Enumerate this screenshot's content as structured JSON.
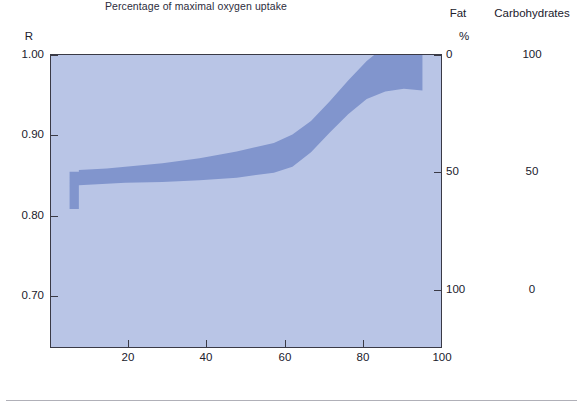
{
  "figure": {
    "y_axis_title": "R",
    "x_axis_title": "Percentage of maximal oxygen uptake",
    "header_fat": "Fat",
    "header_carbohydrates": "Carbohydrates",
    "header_percent": "%"
  },
  "chart_data": {
    "type": "area",
    "title": "",
    "subtitle": "",
    "xlabel": "Percentage of maximal oxygen uptake",
    "ylabel": "R",
    "xlim": [
      0,
      105
    ],
    "ylim": [
      0.655,
      1.0
    ],
    "grid": false,
    "legend": null,
    "x_ticks": [
      20,
      40,
      60,
      80,
      100
    ],
    "x_tick_labels": [
      "20",
      "40",
      "60",
      "80",
      "100"
    ],
    "y_ticks": [
      0.7,
      0.8,
      0.9,
      1.0
    ],
    "y_tick_labels": [
      "0.70",
      "0.80",
      "0.90",
      "1.00"
    ],
    "secondary_axes": [
      {
        "name": "Fat",
        "unit": "%",
        "ticks": [
          0,
          50,
          100
        ],
        "tick_labels": [
          "0",
          "50",
          "100"
        ],
        "tick_R_values": [
          1.0,
          0.855,
          0.707
        ]
      },
      {
        "name": "Carbohydrates",
        "unit": "%",
        "ticks": [
          100,
          50,
          0
        ],
        "tick_labels": [
          "100",
          "50",
          "0"
        ],
        "tick_R_values": [
          1.0,
          0.855,
          0.707
        ]
      }
    ],
    "series": [
      {
        "name": "R band upper bound",
        "x": [
          5,
          5,
          7.5,
          7.5,
          15,
          20,
          30,
          40,
          50,
          60,
          65,
          70,
          75,
          80,
          85,
          87,
          100
        ],
        "values": [
          0.845,
          0.862,
          0.862,
          0.864,
          0.866,
          0.868,
          0.872,
          0.878,
          0.886,
          0.896,
          0.906,
          0.922,
          0.945,
          0.97,
          0.993,
          1.0,
          1.0
        ]
      },
      {
        "name": "R band lower bound",
        "x": [
          5,
          5,
          7.5,
          7.5,
          15,
          20,
          30,
          40,
          50,
          60,
          65,
          70,
          75,
          80,
          85,
          90,
          95,
          100
        ],
        "values": [
          0.845,
          0.818,
          0.818,
          0.846,
          0.848,
          0.849,
          0.85,
          0.852,
          0.855,
          0.861,
          0.868,
          0.885,
          0.908,
          0.93,
          0.948,
          0.957,
          0.96,
          0.958
        ]
      }
    ],
    "band_fill_color": "#8195cd",
    "plot_background_color": "#b9c5e6",
    "axis_color": "#3a3a46"
  },
  "left_axis": {
    "ticks": [
      {
        "label": "1.00",
        "value": 1.0
      },
      {
        "label": "0.90",
        "value": 0.9
      },
      {
        "label": "0.80",
        "value": 0.8
      },
      {
        "label": "0.70",
        "value": 0.7
      }
    ]
  },
  "right_axis": {
    "fat": [
      {
        "label": "0"
      },
      {
        "label": "50"
      },
      {
        "label": "100"
      }
    ],
    "carbohydrates": [
      {
        "label": "100"
      },
      {
        "label": "50"
      },
      {
        "label": "0"
      }
    ]
  },
  "bottom_axis": {
    "ticks": [
      {
        "label": "20"
      },
      {
        "label": "40"
      },
      {
        "label": "60"
      },
      {
        "label": "80"
      },
      {
        "label": "100"
      }
    ]
  }
}
